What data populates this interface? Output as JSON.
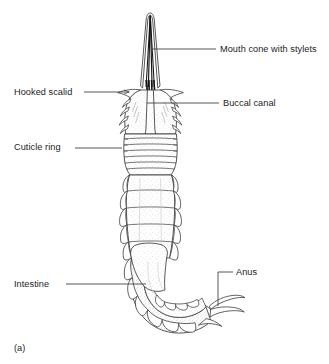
{
  "figure": {
    "caption": "(a)",
    "background_color": "#ffffff",
    "line_color": "#3a3a3a",
    "text_color": "#1c1c1c",
    "stipple_color": "#b9b9b9",
    "stylet_color": "#111111"
  },
  "labels": [
    {
      "id": "mouth-cone",
      "text": "Mouth cone with stylets",
      "side": "right",
      "leader": {
        "x1": 153,
        "y1": 49,
        "x2": 216,
        "y2": 49
      }
    },
    {
      "id": "hooked-scalid",
      "text": "Hooked scalid",
      "side": "left",
      "leader": {
        "x1": 84,
        "y1": 92,
        "x2": 128,
        "y2": 92
      },
      "arrowhead": true
    },
    {
      "id": "buccal-canal",
      "text": "Buccal canal",
      "side": "right",
      "leader": {
        "x1": 147,
        "y1": 103,
        "x2": 220,
        "y2": 103
      }
    },
    {
      "id": "cuticle-ring",
      "text": "Cuticle ring",
      "side": "left",
      "leader": {
        "x1": 75,
        "y1": 148,
        "x2": 121,
        "y2": 148
      }
    },
    {
      "id": "intestine",
      "text": "Intestine",
      "side": "left",
      "leader": {
        "x1": 66,
        "y1": 284,
        "x2": 145,
        "y2": 284
      }
    },
    {
      "id": "anus",
      "text": "Anus",
      "side": "right",
      "leader_path": "M233,272 L218,272 L218,305",
      "elbow": true
    }
  ]
}
